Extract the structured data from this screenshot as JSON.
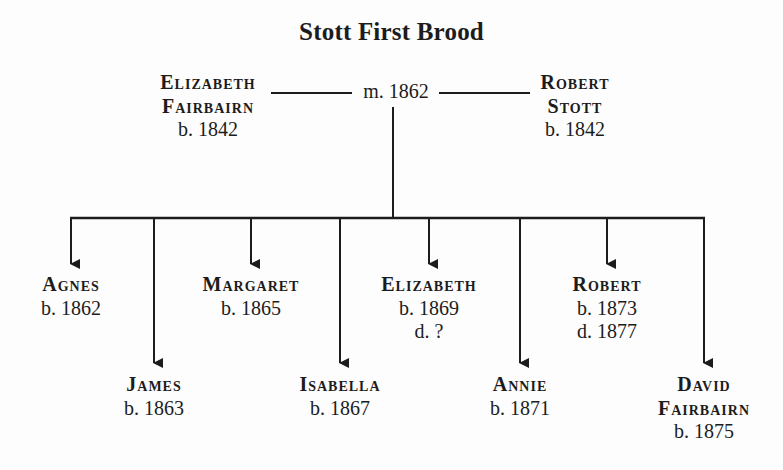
{
  "title": "Stott First Brood",
  "marriage": {
    "label": "m. 1862"
  },
  "parents": [
    {
      "name_lines": [
        "Elizabeth",
        "Fairbairn"
      ],
      "dates": [
        "b. 1842"
      ],
      "x": 208
    },
    {
      "name_lines": [
        "Robert",
        "Stott"
      ],
      "dates": [
        "b. 1842"
      ],
      "x": 575
    }
  ],
  "children": [
    {
      "name_lines": [
        "Agnes"
      ],
      "dates": [
        "b. 1862"
      ],
      "x": 71,
      "row": 1
    },
    {
      "name_lines": [
        "James"
      ],
      "dates": [
        "b. 1863"
      ],
      "x": 154,
      "row": 2
    },
    {
      "name_lines": [
        "Margaret"
      ],
      "dates": [
        "b. 1865"
      ],
      "x": 251,
      "row": 1
    },
    {
      "name_lines": [
        "Isabella"
      ],
      "dates": [
        "b. 1867"
      ],
      "x": 340,
      "row": 2
    },
    {
      "name_lines": [
        "Elizabeth"
      ],
      "dates": [
        "b. 1869",
        "d. ?"
      ],
      "x": 429,
      "row": 1
    },
    {
      "name_lines": [
        "Annie"
      ],
      "dates": [
        "b. 1871"
      ],
      "x": 520,
      "row": 2
    },
    {
      "name_lines": [
        "Robert"
      ],
      "dates": [
        "b. 1873",
        "d. 1877"
      ],
      "x": 607,
      "row": 1
    },
    {
      "name_lines": [
        "David",
        "Fairbairn"
      ],
      "dates": [
        "b. 1875"
      ],
      "x": 704,
      "row": 2
    }
  ]
}
